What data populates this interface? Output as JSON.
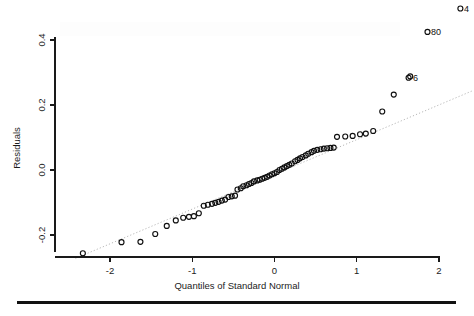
{
  "figure": {
    "kind": "qq-plot",
    "background_color": "#ffffff",
    "point_color": "#0f0f0f",
    "reference_line_color": "#b9b9b9",
    "axis_color": "#1a1a1a"
  },
  "axes": {
    "x_title": "Quantiles of Standard Normal",
    "y_title": "Residuals",
    "x_ticks": [
      "-2",
      "-1",
      "0",
      "1",
      "2"
    ],
    "y_ticks": [
      "-0.2",
      "0.0",
      "0.2",
      "0.4"
    ]
  },
  "outliers": [
    {
      "label": "4",
      "x": 2.26,
      "y": 0.497
    },
    {
      "label": "80",
      "x": 1.86,
      "y": 0.425
    },
    {
      "label": "6",
      "x": 1.64,
      "y": 0.285
    }
  ],
  "chart_data": {
    "type": "scatter",
    "title": "",
    "subtitle": "",
    "xlabel": "Quantiles of Standard Normal",
    "ylabel": "Residuals",
    "xlim": [
      -2.55,
      2.42
    ],
    "ylim": [
      -0.285,
      0.52
    ],
    "xticks": [
      -2,
      -1,
      0,
      1,
      2
    ],
    "yticks": [
      -0.2,
      0.0,
      0.2,
      0.4
    ],
    "grid": false,
    "legend": null,
    "reference_line": {
      "style": "dotted",
      "color": "#b9b9b9",
      "x": [
        -2.42,
        2.4
      ],
      "y": [
        -0.272,
        0.243
      ]
    },
    "annotations": [
      {
        "text": "4",
        "x": 2.26,
        "y": 0.497
      },
      {
        "text": "80",
        "x": 1.86,
        "y": 0.425
      },
      {
        "text": "6",
        "x": 1.64,
        "y": 0.285
      }
    ],
    "series": [
      {
        "name": "Residual quantiles",
        "marker": "open-circle",
        "x": [
          -2.33,
          -1.86,
          -1.63,
          -1.45,
          -1.31,
          -1.2,
          -1.11,
          -1.04,
          -0.98,
          -0.92,
          -0.86,
          -0.81,
          -0.76,
          -0.72,
          -0.68,
          -0.64,
          -0.6,
          -0.56,
          -0.52,
          -0.48,
          -0.45,
          -0.41,
          -0.38,
          -0.34,
          -0.31,
          -0.28,
          -0.25,
          -0.21,
          -0.18,
          -0.15,
          -0.12,
          -0.09,
          -0.06,
          -0.03,
          0.0,
          0.03,
          0.06,
          0.09,
          0.12,
          0.15,
          0.18,
          0.21,
          0.25,
          0.28,
          0.31,
          0.34,
          0.38,
          0.41,
          0.45,
          0.48,
          0.52,
          0.56,
          0.6,
          0.64,
          0.68,
          0.72,
          0.76,
          0.86,
          0.95,
          1.04,
          1.11,
          1.2,
          1.31,
          1.45,
          1.63,
          1.65,
          1.86,
          2.26
        ],
        "y": [
          -0.256,
          -0.222,
          -0.221,
          -0.197,
          -0.172,
          -0.155,
          -0.147,
          -0.144,
          -0.142,
          -0.133,
          -0.11,
          -0.107,
          -0.104,
          -0.101,
          -0.098,
          -0.094,
          -0.091,
          -0.083,
          -0.081,
          -0.079,
          -0.06,
          -0.056,
          -0.05,
          -0.047,
          -0.043,
          -0.04,
          -0.035,
          -0.032,
          -0.03,
          -0.027,
          -0.024,
          -0.021,
          -0.017,
          -0.013,
          -0.01,
          -0.006,
          0.0,
          0.004,
          0.008,
          0.012,
          0.016,
          0.02,
          0.027,
          0.031,
          0.036,
          0.04,
          0.045,
          0.05,
          0.055,
          0.059,
          0.062,
          0.064,
          0.066,
          0.067,
          0.068,
          0.069,
          0.102,
          0.103,
          0.105,
          0.11,
          0.112,
          0.12,
          0.18,
          0.232,
          0.284,
          0.288,
          0.425,
          0.497
        ]
      }
    ]
  }
}
